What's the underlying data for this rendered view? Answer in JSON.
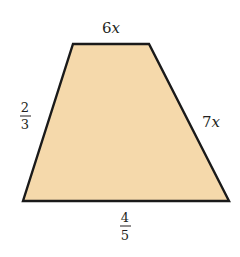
{
  "figure": {
    "shape": "trapezoid",
    "fill_color": "#F5D9AB",
    "stroke_color": "#1a1a1a",
    "labels": {
      "top": {
        "coef": "6",
        "var": "x"
      },
      "right": {
        "coef": "7",
        "var": "x"
      },
      "left": {
        "numerator": "2",
        "denominator": "3"
      },
      "bottom": {
        "numerator": "4",
        "denominator": "5"
      }
    }
  }
}
